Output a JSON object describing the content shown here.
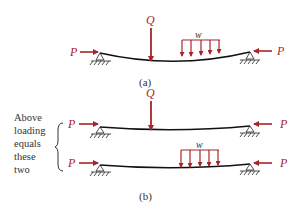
{
  "diagram": {
    "type": "structural-loading-superposition",
    "colors": {
      "load": "#a8242a",
      "beam": "#111111",
      "text": "#333333"
    },
    "panel_a": {
      "caption": "(a)",
      "loads": {
        "axial_left": "P",
        "axial_right": "P",
        "point_load": "Q",
        "distributed_load": "w"
      }
    },
    "panel_b": {
      "caption": "(b)",
      "side_text": [
        "Above",
        "loading",
        "equals",
        "these",
        "two"
      ],
      "top_beam": {
        "axial_left": "P",
        "axial_right": "P",
        "point_load": "Q"
      },
      "bottom_beam": {
        "axial_left": "P",
        "axial_right": "P",
        "distributed_load": "w"
      }
    }
  }
}
